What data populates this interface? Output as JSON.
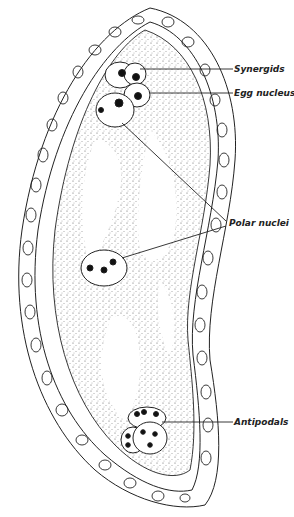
{
  "diagram": {
    "labels": {
      "synergids": "Synergids",
      "egg_nucleus": "Egg nucleus",
      "polar_nuclei": "Polar nuclei",
      "antipodals": "Antipodals"
    },
    "colors": {
      "ink": "#222222",
      "background": "#ffffff"
    }
  }
}
